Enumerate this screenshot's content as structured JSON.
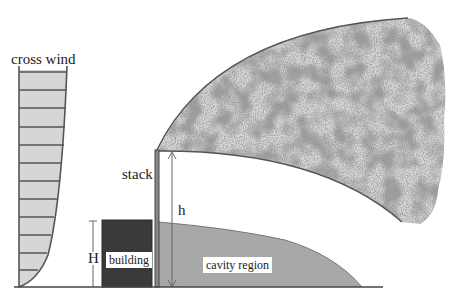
{
  "diagram": {
    "type": "plume dispersion schematic",
    "labels": {
      "cross_wind": "cross wind",
      "stack": "stack",
      "stack_height": "h",
      "building_height": "H",
      "building": "building",
      "cavity": "cavity region"
    },
    "colors": {
      "line": "#555555",
      "wind_fill": "#d6d6d6",
      "building_fill": "#3a3a3a",
      "cavity_fill": "#a8a8a8",
      "plume_dark": "#555555",
      "plume_light": "#9a9a9a"
    },
    "elements": [
      "cross wind velocity profile",
      "building",
      "stack",
      "plume",
      "cavity region",
      "ground line"
    ]
  }
}
